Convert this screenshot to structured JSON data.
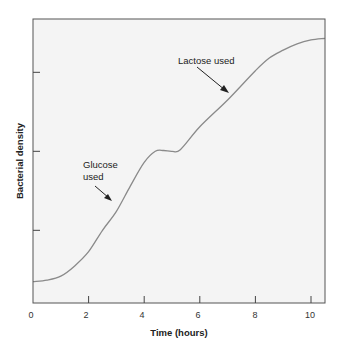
{
  "chart_data": {
    "type": "line",
    "title": "",
    "xlabel": "Time (hours)",
    "ylabel": "Bacterial density",
    "xlim": [
      0,
      10.5
    ],
    "ylim": [
      0,
      3.6
    ],
    "xticks": [
      0,
      2,
      4,
      6,
      8,
      10
    ],
    "xtick_labels": [
      "0",
      "2",
      "4",
      "6",
      "8",
      "10"
    ],
    "yticks": [
      0.92,
      1.92,
      2.92
    ],
    "ytick_labels": [
      "",
      "",
      ""
    ],
    "grid": false,
    "legend": null,
    "series": [
      {
        "name": "Bacterial density",
        "color": "#8a8a8a",
        "x": [
          0,
          0.5,
          1,
          1.5,
          2,
          2.5,
          3,
          3.5,
          4,
          4.4,
          4.7,
          5,
          5.3,
          6,
          7,
          8,
          8.5,
          9,
          9.5,
          10,
          10.5
        ],
        "values": [
          0.27,
          0.29,
          0.34,
          0.47,
          0.65,
          0.92,
          1.16,
          1.48,
          1.78,
          1.92,
          1.93,
          1.92,
          1.94,
          2.23,
          2.57,
          2.94,
          3.1,
          3.2,
          3.28,
          3.33,
          3.35
        ]
      }
    ],
    "annotations": [
      {
        "text_lines": [
          "Glucose",
          "used"
        ],
        "arrow_to_x": 3.0,
        "arrow_to_y": 1.2
      },
      {
        "text_lines": [
          "Lactose used"
        ],
        "arrow_to_x": 7.1,
        "arrow_to_y": 2.62
      }
    ]
  },
  "labels": {
    "xlabel": "Time (hours)",
    "ylabel": "Bacterial density",
    "glucose_line1": "Glucose",
    "glucose_line2": "used",
    "lactose": "Lactose used",
    "xtick_0": "0",
    "xtick_1": "2",
    "xtick_2": "4",
    "xtick_3": "6",
    "xtick_4": "8",
    "xtick_5": "10"
  }
}
